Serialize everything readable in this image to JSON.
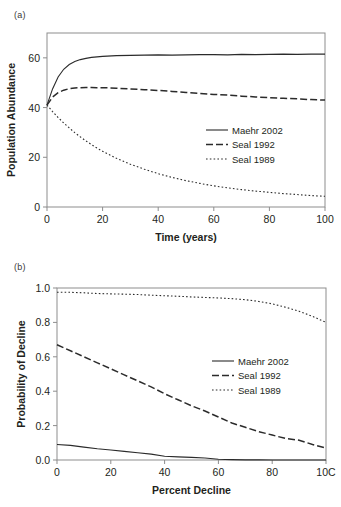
{
  "figure": {
    "panels": [
      {
        "label": "(a)",
        "chart_index": 0
      },
      {
        "label": "(b)",
        "chart_index": 1
      }
    ]
  },
  "chart_data": [
    {
      "type": "line",
      "panel": "(a)",
      "title": "",
      "xlabel": "Time (years)",
      "ylabel": "Population Abundance",
      "xlim": [
        0,
        100
      ],
      "ylim": [
        0,
        70
      ],
      "xticks": [
        0,
        20,
        40,
        60,
        80,
        100
      ],
      "xticklabels": [
        "0",
        "20",
        "40",
        "60",
        "80",
        "100"
      ],
      "yticks": [
        0,
        20,
        40,
        60
      ],
      "yticklabels": [
        "0",
        "20",
        "40",
        "60"
      ],
      "grid": false,
      "legend_position": "center-right",
      "x": [
        0,
        2,
        4,
        6,
        8,
        10,
        12,
        14,
        16,
        18,
        20,
        25,
        30,
        35,
        40,
        45,
        50,
        55,
        60,
        65,
        70,
        75,
        80,
        85,
        90,
        95,
        100
      ],
      "series": [
        {
          "name": "Maehr 2002",
          "style": "solid",
          "values": [
            41.0,
            47.5,
            52.3,
            55.4,
            57.3,
            58.5,
            59.3,
            59.8,
            60.2,
            60.4,
            60.6,
            60.9,
            61.0,
            61.1,
            61.2,
            61.1,
            61.2,
            61.3,
            61.3,
            61.2,
            61.4,
            61.3,
            61.4,
            61.5,
            61.4,
            61.5,
            61.5
          ]
        },
        {
          "name": "Seal 1992",
          "style": "dashed",
          "values": [
            41.0,
            44.2,
            46.0,
            47.0,
            47.6,
            47.9,
            48.0,
            48.1,
            48.1,
            48.0,
            48.0,
            47.8,
            47.5,
            47.2,
            46.9,
            46.5,
            46.1,
            45.7,
            45.3,
            45.0,
            44.6,
            44.3,
            44.0,
            43.7,
            43.5,
            43.2,
            43.0
          ]
        },
        {
          "name": "Seal 1989",
          "style": "dotted",
          "values": [
            41.0,
            38.4,
            36.0,
            33.8,
            31.8,
            29.9,
            28.2,
            26.6,
            25.1,
            23.7,
            22.4,
            19.6,
            17.2,
            15.2,
            13.4,
            11.9,
            10.6,
            9.5,
            8.5,
            7.7,
            7.0,
            6.4,
            5.9,
            5.4,
            5.0,
            4.6,
            4.3
          ]
        }
      ]
    },
    {
      "type": "line",
      "panel": "(b)",
      "title": "",
      "xlabel": "Percent Decline",
      "ylabel": "Probability of Decline",
      "xlim": [
        0,
        100
      ],
      "ylim": [
        0.0,
        1.0
      ],
      "xticks": [
        0,
        20,
        40,
        60,
        80,
        100
      ],
      "xticklabels": [
        "0",
        "20",
        "40",
        "60",
        "80",
        "10C"
      ],
      "yticks": [
        0.0,
        0.2,
        0.4,
        0.6,
        0.8,
        1.0
      ],
      "yticklabels": [
        "0.0",
        "0.2",
        "0.4",
        "0.6",
        "0.8",
        "1.0"
      ],
      "grid": false,
      "legend_position": "center-right",
      "x": [
        0,
        5,
        10,
        15,
        20,
        25,
        30,
        35,
        40,
        45,
        50,
        55,
        60,
        65,
        70,
        75,
        80,
        85,
        90,
        95,
        100
      ],
      "series": [
        {
          "name": "Maehr 2002",
          "style": "solid",
          "values": [
            0.09,
            0.085,
            0.075,
            0.065,
            0.058,
            0.05,
            0.042,
            0.034,
            0.022,
            0.018,
            0.015,
            0.012,
            0.004,
            0.002,
            0.001,
            0.001,
            0.0,
            0.0,
            0.0,
            0.0,
            0.0
          ]
        },
        {
          "name": "Seal 1992",
          "style": "dashed",
          "values": [
            0.67,
            0.635,
            0.6,
            0.565,
            0.53,
            0.495,
            0.46,
            0.425,
            0.385,
            0.35,
            0.315,
            0.285,
            0.25,
            0.215,
            0.19,
            0.165,
            0.145,
            0.125,
            0.115,
            0.09,
            0.07
          ]
        },
        {
          "name": "Seal 1989",
          "style": "dotted",
          "values": [
            0.975,
            0.975,
            0.972,
            0.968,
            0.966,
            0.964,
            0.962,
            0.958,
            0.955,
            0.952,
            0.948,
            0.945,
            0.942,
            0.938,
            0.932,
            0.922,
            0.908,
            0.888,
            0.865,
            0.835,
            0.8
          ]
        }
      ]
    }
  ]
}
